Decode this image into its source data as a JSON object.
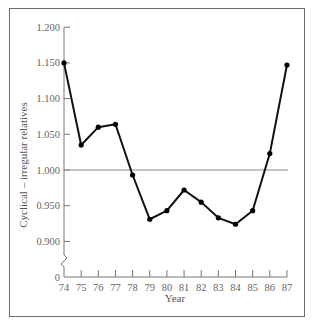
{
  "chart_data": {
    "type": "line",
    "title": "",
    "xlabel": "Year",
    "ylabel": "Cyclical – irregular relatives",
    "x": [
      "74",
      "75",
      "76",
      "77",
      "78",
      "79",
      "80",
      "81",
      "82",
      "83",
      "84",
      "85",
      "86",
      "87"
    ],
    "series": [
      {
        "name": "Cyclical-irregular relatives",
        "values": [
          1.15,
          1.035,
          1.06,
          1.064,
          0.993,
          0.931,
          0.943,
          0.972,
          0.955,
          0.933,
          0.924,
          0.943,
          1.023,
          1.147
        ]
      }
    ],
    "yticks": [
      "0",
      "0.900",
      "0.950",
      "1.000",
      "1.050",
      "1.100",
      "1.150",
      "1.200"
    ],
    "ylim": [
      0.9,
      1.2
    ],
    "y_axis_break": true,
    "reference_line": 1.0,
    "grid": false,
    "legend": "none"
  },
  "labels": {
    "xlabel": "Year",
    "ylabel": "Cyclical – irregular relatives"
  }
}
